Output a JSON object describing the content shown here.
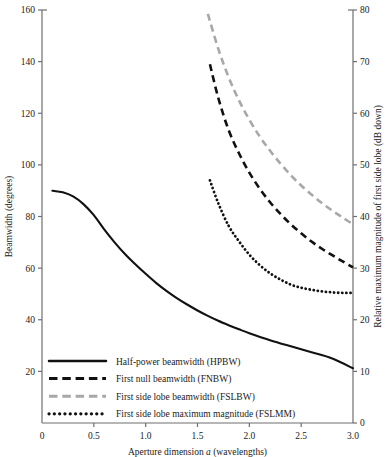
{
  "chart_data": {
    "type": "line",
    "title": "",
    "xlabel": "Aperture dimension a (wavelengths)",
    "xlabel_prefix": "Aperture dimension ",
    "xlabel_italic": "a",
    "xlabel_suffix": " (wavelengths)",
    "ylabel": "Beamwidth (degrees)",
    "ylabel_right": "Relative maximum magnitude of first side lobe (dB down)",
    "xlim": [
      0,
      3.0
    ],
    "ylim": [
      0,
      160
    ],
    "ylim_right": [
      0,
      80
    ],
    "grid": false,
    "legend_position": "lower-left-inside",
    "xticks": [
      0,
      0.5,
      1.0,
      1.5,
      2.0,
      2.5,
      3.0
    ],
    "xticklabels": [
      "0",
      "0.5",
      "1.0",
      "1.5",
      "2.0",
      "2.5",
      "3.0"
    ],
    "yticks": [
      20,
      40,
      60,
      80,
      100,
      120,
      140,
      160
    ],
    "yticklabels": [
      "20",
      "40",
      "60",
      "80",
      "100",
      "120",
      "140",
      "160"
    ],
    "yticks_right": [
      0,
      10,
      20,
      30,
      40,
      50,
      60,
      70,
      80
    ],
    "yticklabels_right": [
      "0",
      "10",
      "20",
      "30",
      "40",
      "50",
      "60",
      "70",
      "80"
    ],
    "series": [
      {
        "name": "Half-power beamwidth (HPBW)",
        "style": "solid",
        "color": "#111111",
        "axis": "left",
        "x": [
          0.1,
          0.2,
          0.3,
          0.4,
          0.5,
          0.6,
          0.7,
          0.8,
          0.9,
          1.0,
          1.1,
          1.2,
          1.3,
          1.4,
          1.5,
          1.6,
          1.7,
          1.8,
          1.9,
          2.0,
          2.2,
          2.4,
          2.6,
          2.8,
          3.0
        ],
        "y": [
          90.0,
          89.4,
          87.8,
          84.8,
          80.5,
          75.0,
          70.0,
          65.5,
          61.5,
          57.8,
          54.3,
          51.2,
          48.4,
          45.9,
          43.6,
          41.5,
          39.6,
          37.9,
          36.3,
          34.8,
          32.1,
          29.7,
          27.4,
          25.0,
          21.2
        ]
      },
      {
        "name": "First null beamwidth (FNBW)",
        "style": "dashed",
        "color": "#111111",
        "axis": "left",
        "x": [
          1.62,
          1.7,
          1.8,
          1.9,
          2.0,
          2.1,
          2.2,
          2.3,
          2.4,
          2.5,
          2.6,
          2.7,
          2.8,
          2.9,
          3.0
        ],
        "y": [
          139.0,
          126.0,
          113.5,
          104.5,
          97.0,
          90.8,
          85.5,
          81.0,
          77.0,
          73.5,
          70.3,
          67.5,
          65.0,
          62.6,
          60.3
        ]
      },
      {
        "name": "First side lobe beamwidth (FSLBW)",
        "style": "dashed",
        "color": "#a8a8a8",
        "axis": "left",
        "x": [
          1.6,
          1.7,
          1.8,
          1.9,
          2.0,
          2.1,
          2.2,
          2.3,
          2.4,
          2.5,
          2.6,
          2.7,
          2.8,
          2.9,
          3.0
        ],
        "y": [
          158.5,
          145.0,
          134.0,
          125.0,
          117.5,
          111.0,
          105.5,
          100.5,
          96.0,
          92.0,
          88.5,
          85.2,
          82.3,
          79.6,
          77.0
        ]
      },
      {
        "name": "First side lobe maximum magnitude (FSLMM)",
        "style": "dotted",
        "color": "#111111",
        "axis": "right",
        "x": [
          1.62,
          1.7,
          1.8,
          1.9,
          2.0,
          2.1,
          2.2,
          2.3,
          2.4,
          2.5,
          2.6,
          2.7,
          2.8,
          2.9,
          3.0
        ],
        "y_right": [
          47.0,
          42.6,
          38.2,
          35.2,
          32.6,
          30.6,
          29.0,
          27.8,
          26.8,
          26.2,
          25.8,
          25.5,
          25.3,
          25.2,
          25.2
        ]
      }
    ],
    "legend": [
      {
        "label": "Half-power beamwidth (HPBW)",
        "style": "solid",
        "color": "#111111"
      },
      {
        "label": "First null beamwidth (FNBW)",
        "style": "dashed",
        "color": "#111111"
      },
      {
        "label": "First side lobe beamwidth (FSLBW)",
        "style": "dashed",
        "color": "#a8a8a8"
      },
      {
        "label": "First side lobe maximum magnitude (FSLMM)",
        "style": "dotted",
        "color": "#111111"
      }
    ]
  },
  "colors": {
    "axis": "#6f6f6f",
    "text": "#1a1a1a",
    "series_black": "#111111",
    "series_grey": "#a8a8a8",
    "background": "#ffffff"
  }
}
